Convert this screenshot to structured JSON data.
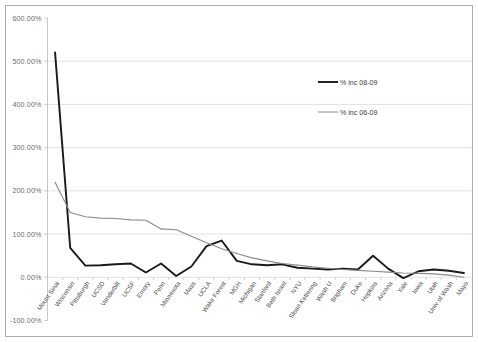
{
  "chart_data": {
    "type": "line",
    "title": "",
    "subtitle": "",
    "xlabel": "",
    "ylabel": "",
    "ylim": [
      -100,
      600
    ],
    "grid": true,
    "legend_position": "center-right",
    "ytick_labels": [
      "600.00%",
      "500.00%",
      "400.00%",
      "300.00%",
      "200.00%",
      "100.00%",
      "0.00%",
      "-100.00%"
    ],
    "ytick_values": [
      600,
      500,
      400,
      300,
      200,
      100,
      0,
      -100
    ],
    "categories": [
      "Mount Sinai",
      "Wisconsin",
      "Pittsburgh",
      "UCSD",
      "Vanderbilt",
      "UCSF",
      "Emory",
      "Penn",
      "Minnesota",
      "Mass",
      "UCLA",
      "Wake Forest",
      "MGH",
      "Michigan",
      "Stanford",
      "Beth Israel",
      "NYU",
      "Sloan Kettering",
      "Wash U",
      "Brigham",
      "Duke",
      "Hopkins",
      "Arizona",
      "Yale",
      "Iowa",
      "Utah",
      "Univ of Wash",
      "Mayo"
    ],
    "series": [
      {
        "name": "% inc 08-09",
        "color": "#1a1a1a",
        "values": [
          520,
          68,
          27,
          28,
          30,
          32,
          11,
          32,
          3,
          25,
          72,
          85,
          38,
          30,
          28,
          30,
          22,
          20,
          18,
          20,
          18,
          50,
          20,
          -2,
          14,
          18,
          15,
          10
        ]
      },
      {
        "name": "% inc 06-09",
        "color": "#8c8c8c",
        "values": [
          220,
          150,
          140,
          137,
          136,
          133,
          132,
          112,
          110,
          95,
          80,
          66,
          55,
          45,
          38,
          32,
          28,
          24,
          21,
          18,
          16,
          14,
          12,
          10,
          9,
          8,
          5,
          0
        ]
      }
    ]
  },
  "legend": {
    "entries": [
      {
        "label": "% inc 08-09",
        "color": "#1a1a1a"
      },
      {
        "label": "% inc 06-09",
        "color": "#8c8c8c"
      }
    ]
  }
}
